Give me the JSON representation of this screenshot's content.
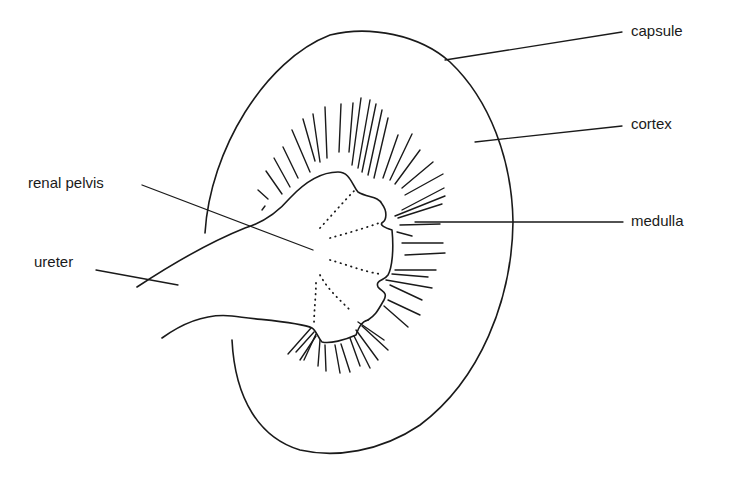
{
  "figure": {
    "labels": {
      "capsule": "capsule",
      "cortex": "cortex",
      "medulla": "medulla",
      "renal_pelvis": "renal pelvis",
      "ureter": "ureter"
    },
    "colors": {
      "line": "#1a1a1a",
      "background": "#ffffff"
    }
  }
}
